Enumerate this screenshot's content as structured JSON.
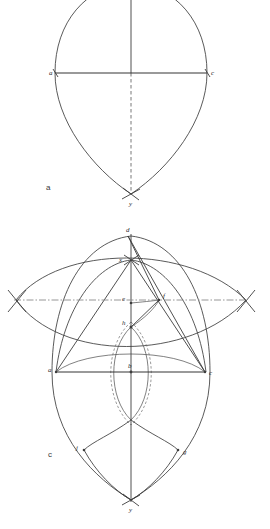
{
  "page": {
    "background_color": "#ffffff",
    "ink_color": "#3c3c3c",
    "width": 270,
    "height": 529
  },
  "figures": [
    {
      "key": "a",
      "caption": "a",
      "caption_pos": {
        "x": 46,
        "y": 188
      },
      "description": "Pointed oval (vesica / gothic arch) with horizontal chord a-c, solid vertical axis above chord and dashed vertical axis below, terminating at crossed point y.",
      "points": [
        {
          "name": "a",
          "label": "a",
          "x": 55,
          "y": 73,
          "label_dx": -6,
          "label_dy": 2
        },
        {
          "name": "c",
          "label": "c",
          "x": 207,
          "y": 73,
          "label_dx": 4,
          "label_dy": 2
        },
        {
          "name": "y",
          "label": "y",
          "x": 131,
          "y": 194,
          "label_dx": 1,
          "label_dy": 10
        }
      ]
    },
    {
      "key": "c",
      "caption": "c",
      "caption_pos": {
        "x": 50,
        "y": 455
      },
      "description": "Compound construction: large vertical pointed oval, wide horizontal lens, inner small lens, radial straight lines from d to c and from x, with dash-dot horizontal construction line crossing X-marks at both extremes.",
      "points": [
        {
          "name": "d",
          "label": "d",
          "x": 128,
          "y": 236,
          "label_dx": -1,
          "label_dy": -3
        },
        {
          "name": "x",
          "label": "x",
          "x": 131,
          "y": 260,
          "label_dx": -8,
          "label_dy": 1
        },
        {
          "name": "e",
          "label": "e",
          "x": 131,
          "y": 303,
          "label_dx": -7,
          "label_dy": 1
        },
        {
          "name": "f",
          "label": "f",
          "x": 159,
          "y": 300,
          "label_dx": 4,
          "label_dy": -1
        },
        {
          "name": "h",
          "label": "h",
          "x": 131,
          "y": 327,
          "label_dx": -7,
          "label_dy": -1
        },
        {
          "name": "a",
          "label": "a",
          "x": 56,
          "y": 372,
          "label_dx": -7,
          "label_dy": 1
        },
        {
          "name": "b",
          "label": "b",
          "x": 131,
          "y": 372,
          "label_dx": -1,
          "label_dy": -4
        },
        {
          "name": "c",
          "label": "c",
          "x": 205,
          "y": 372,
          "label_dx": 5,
          "label_dy": 2
        },
        {
          "name": "j",
          "label": "j",
          "x": 84,
          "y": 450,
          "label_dx": -6,
          "label_dy": 1
        },
        {
          "name": "g",
          "label": "g",
          "x": 178,
          "y": 450,
          "label_dx": 5,
          "label_dy": 3
        },
        {
          "name": "y",
          "label": "y",
          "x": 131,
          "y": 500,
          "label_dx": 1,
          "label_dy": 11
        }
      ],
      "cross_marks": [
        {
          "name": "left-cross",
          "x": 16,
          "y": 300
        },
        {
          "name": "right-cross",
          "x": 246,
          "y": 300
        }
      ]
    }
  ]
}
